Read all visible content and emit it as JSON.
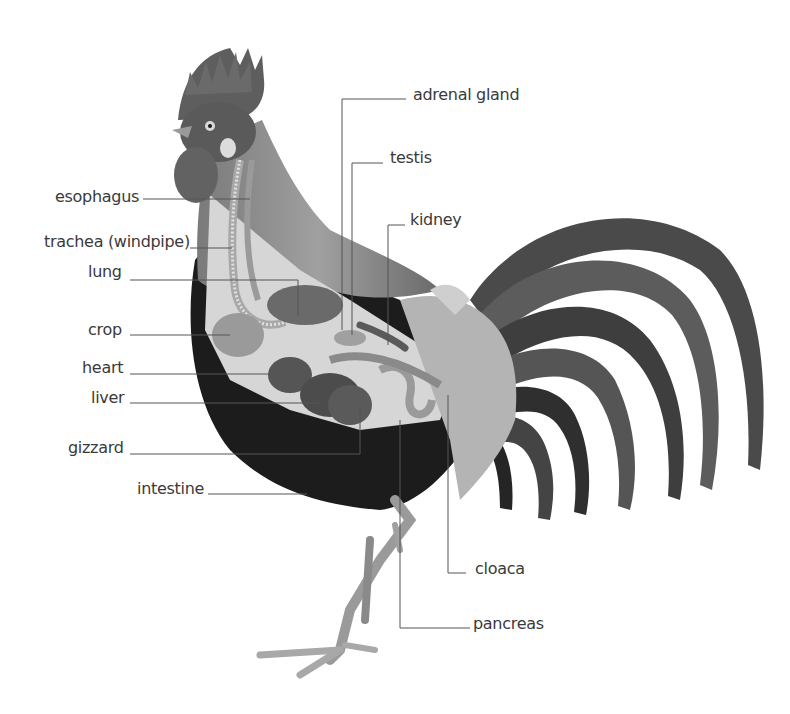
{
  "diagram": {
    "colors": {
      "background": "#ffffff",
      "label_text": "#3a3a3a",
      "leader_line": "#555555",
      "body_dark": "#1a1a1a",
      "body_mid": "#6e6e6e",
      "organs": "#8a8a8a",
      "hackle_light": "#c8c8c8"
    },
    "labels": {
      "esophagus": "esophagus",
      "trachea": "trachea (windpipe)",
      "lung": "lung",
      "crop": "crop",
      "heart": "heart",
      "liver": "liver",
      "gizzard": "gizzard",
      "intestine": "intestine",
      "adrenal_gland": "adrenal gland",
      "testis": "testis",
      "kidney": "kidney",
      "cloaca": "cloaca",
      "pancreas": "pancreas"
    }
  }
}
